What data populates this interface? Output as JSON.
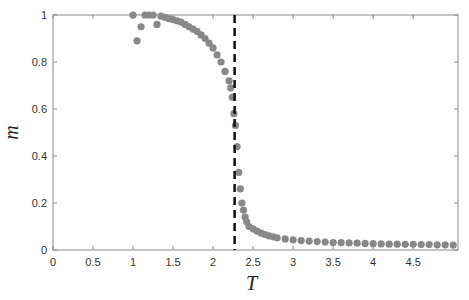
{
  "chart_data": {
    "type": "scatter",
    "title": "",
    "xlabel": "T",
    "ylabel": "m",
    "xlim": [
      0,
      5
    ],
    "ylim": [
      0,
      1
    ],
    "xticks": [
      "0",
      "0.5",
      "1",
      "1.5",
      "2",
      "2.5",
      "3",
      "3.5",
      "4",
      "4.5"
    ],
    "yticks": [
      "0",
      "0.2",
      "0.4",
      "0.6",
      "0.8",
      "1"
    ],
    "grid": false,
    "marker_color": "#888888",
    "annotations": [
      {
        "type": "vertical-dashed-line",
        "x": 2.269,
        "color": "#111111"
      }
    ],
    "series": [
      {
        "name": "magnetization",
        "x": [
          1.0,
          1.05,
          1.1,
          1.15,
          1.2,
          1.25,
          1.3,
          1.35,
          1.4,
          1.45,
          1.5,
          1.55,
          1.6,
          1.65,
          1.7,
          1.75,
          1.8,
          1.85,
          1.9,
          1.95,
          2.0,
          2.05,
          2.1,
          2.15,
          2.2,
          2.22,
          2.24,
          2.26,
          2.28,
          2.3,
          2.32,
          2.34,
          2.36,
          2.38,
          2.4,
          2.42,
          2.45,
          2.5,
          2.55,
          2.6,
          2.65,
          2.7,
          2.75,
          2.8,
          2.9,
          3.0,
          3.1,
          3.2,
          3.3,
          3.4,
          3.5,
          3.6,
          3.7,
          3.8,
          3.9,
          4.0,
          4.1,
          4.2,
          4.3,
          4.4,
          4.5,
          4.6,
          4.7,
          4.8,
          4.9,
          5.0
        ],
        "y": [
          1.0,
          0.89,
          0.95,
          1.0,
          1.0,
          1.0,
          0.96,
          0.995,
          0.99,
          0.985,
          0.98,
          0.975,
          0.97,
          0.96,
          0.95,
          0.94,
          0.93,
          0.915,
          0.9,
          0.88,
          0.86,
          0.83,
          0.8,
          0.76,
          0.72,
          0.69,
          0.65,
          0.58,
          0.53,
          0.44,
          0.33,
          0.26,
          0.2,
          0.17,
          0.14,
          0.12,
          0.1,
          0.09,
          0.08,
          0.072,
          0.066,
          0.06,
          0.056,
          0.052,
          0.047,
          0.043,
          0.04,
          0.038,
          0.036,
          0.034,
          0.032,
          0.031,
          0.03,
          0.029,
          0.028,
          0.027,
          0.026,
          0.025,
          0.025,
          0.024,
          0.024,
          0.023,
          0.023,
          0.022,
          0.022,
          0.021
        ]
      }
    ]
  }
}
